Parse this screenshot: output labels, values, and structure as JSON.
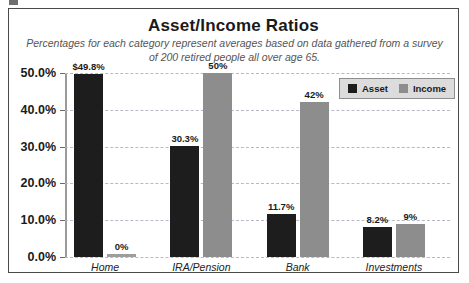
{
  "chart_data": {
    "type": "bar",
    "title": "Asset/Income Ratios",
    "subtitle": "Percentages for each category represent averages based on data gathered from a survey of 200 retired people all over age 65.",
    "categories": [
      "Home",
      "IRA/Pension",
      "Bank",
      "Investments"
    ],
    "series": [
      {
        "name": "Asset",
        "color": "#1d1d1d",
        "values": [
          49.8,
          30.3,
          11.7,
          8.2
        ],
        "labels": [
          "$49.8%",
          "30.3%",
          "11.7%",
          "8.2%"
        ]
      },
      {
        "name": "Income",
        "color": "#8d8d8d",
        "values": [
          0,
          50,
          42,
          9
        ],
        "labels": [
          "0%",
          "50%",
          "42%",
          "9%"
        ]
      }
    ],
    "xlabel": "",
    "ylabel": "",
    "ylim": [
      0,
      50
    ],
    "yticks": [
      0,
      10,
      20,
      30,
      40,
      50
    ],
    "ytick_labels": [
      "0.0%",
      "10.0%",
      "20.0%",
      "30.0%",
      "40.0%",
      "50.0%"
    ],
    "grid": true,
    "legend_position": "top-right"
  }
}
